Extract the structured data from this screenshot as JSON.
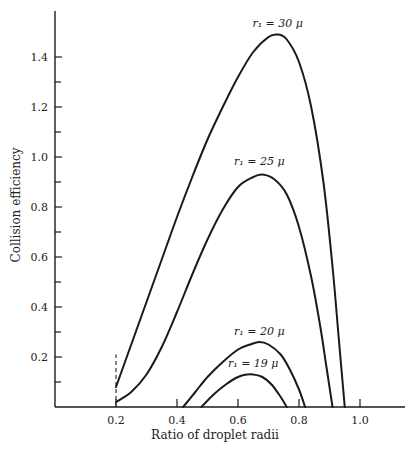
{
  "chart_data": {
    "type": "line",
    "title": "",
    "xlabel": "Ratio of droplet radii",
    "ylabel": "Collision efficiency",
    "xlim": [
      0,
      1.15
    ],
    "ylim": [
      0,
      1.55
    ],
    "x_ticks": [
      0.2,
      0.4,
      0.6,
      0.8,
      1.0
    ],
    "x_tick_labels": [
      "0.2",
      "0.4",
      "0.6",
      "0.8",
      "1.0"
    ],
    "y_ticks_major": [
      0.2,
      0.4,
      0.6,
      0.8,
      1.0,
      1.2,
      1.4
    ],
    "y_tick_labels": [
      "0.2",
      "0.4",
      "0.6",
      "0.8",
      "1.0",
      "1.2",
      "1.4"
    ],
    "y_ticks_minor": [
      0.1,
      0.3,
      0.5,
      0.7,
      0.9,
      1.1,
      1.3
    ],
    "grid": false,
    "legend": "inline labels above each curve",
    "annotations": [
      {
        "type": "dashed-vertical-line",
        "x": 0.2,
        "y_from": 0.0,
        "y_to": 0.21
      }
    ],
    "series": [
      {
        "name": "r1 = 30 μ",
        "label": "r₁ = 30 μ",
        "x": [
          0.2,
          0.25,
          0.3,
          0.35,
          0.4,
          0.45,
          0.5,
          0.55,
          0.6,
          0.65,
          0.7,
          0.73,
          0.76,
          0.8,
          0.84,
          0.88,
          0.91,
          0.93,
          0.95
        ],
        "y": [
          0.08,
          0.25,
          0.42,
          0.59,
          0.76,
          0.92,
          1.07,
          1.2,
          1.32,
          1.42,
          1.48,
          1.49,
          1.47,
          1.38,
          1.2,
          0.9,
          0.56,
          0.28,
          0.0
        ]
      },
      {
        "name": "r1 = 25 μ",
        "label": "r₁ = 25 μ",
        "x": [
          0.2,
          0.25,
          0.3,
          0.35,
          0.4,
          0.45,
          0.5,
          0.55,
          0.6,
          0.65,
          0.68,
          0.72,
          0.76,
          0.8,
          0.84,
          0.87,
          0.89,
          0.91
        ],
        "y": [
          0.02,
          0.06,
          0.13,
          0.24,
          0.38,
          0.53,
          0.67,
          0.79,
          0.88,
          0.92,
          0.93,
          0.91,
          0.85,
          0.72,
          0.52,
          0.32,
          0.16,
          0.0
        ]
      },
      {
        "name": "r1 = 20 μ",
        "label": "r₁ = 20 μ",
        "x": [
          0.42,
          0.46,
          0.5,
          0.55,
          0.6,
          0.64,
          0.67,
          0.7,
          0.74,
          0.77,
          0.8,
          0.82
        ],
        "y": [
          0.0,
          0.06,
          0.12,
          0.18,
          0.23,
          0.25,
          0.26,
          0.25,
          0.21,
          0.15,
          0.07,
          0.0
        ]
      },
      {
        "name": "r1 = 19 μ",
        "label": "r₁ = 19 μ",
        "x": [
          0.48,
          0.52,
          0.56,
          0.6,
          0.63,
          0.65,
          0.68,
          0.71,
          0.74,
          0.76
        ],
        "y": [
          0.0,
          0.05,
          0.09,
          0.12,
          0.13,
          0.13,
          0.12,
          0.09,
          0.04,
          0.0
        ]
      }
    ],
    "label_positions": [
      {
        "series": 0,
        "x": 0.73,
        "y": 1.52
      },
      {
        "series": 1,
        "x": 0.67,
        "y": 0.97
      },
      {
        "series": 2,
        "x": 0.67,
        "y": 0.29
      },
      {
        "series": 3,
        "x": 0.65,
        "y": 0.16
      }
    ]
  }
}
